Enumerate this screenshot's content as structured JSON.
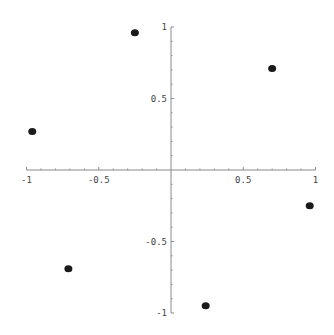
{
  "chart_data": {
    "type": "scatter",
    "title": "",
    "xlabel": "",
    "ylabel": "",
    "xlim": [
      -1,
      1
    ],
    "ylim": [
      -1,
      1
    ],
    "grid": false,
    "legend": null,
    "axes_origin": [
      0,
      0
    ],
    "x_ticks_major": [
      -1,
      -0.5,
      0.5,
      1
    ],
    "x_tick_labels": [
      "-1",
      "-0.5",
      "0.5",
      "1"
    ],
    "y_ticks_major": [
      1,
      0.5,
      -0.5,
      -1
    ],
    "y_tick_labels": [
      "1",
      "0.5",
      "-0.5",
      "-1"
    ],
    "minor_tick_step": 0.1,
    "series": [
      {
        "name": "points",
        "marker": "filled-circle",
        "color": "#1a1a1a",
        "points": [
          {
            "x": -0.25,
            "y": 0.96
          },
          {
            "x": 0.7,
            "y": 0.71
          },
          {
            "x": -0.96,
            "y": 0.27
          },
          {
            "x": 0.96,
            "y": -0.25
          },
          {
            "x": -0.71,
            "y": -0.69
          },
          {
            "x": 0.24,
            "y": -0.95
          }
        ]
      }
    ]
  },
  "layout": {
    "origin_px": [
      171,
      170
    ],
    "x_scale_px": 144.5,
    "y_scale_px": 143
  }
}
